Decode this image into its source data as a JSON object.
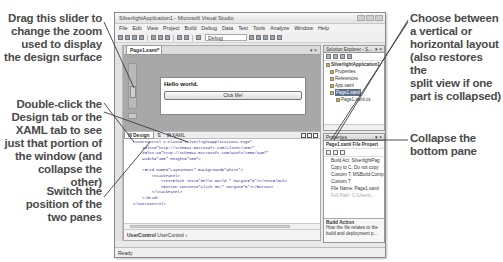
{
  "callouts": {
    "zoom_slider": [
      "Drag this slider to",
      "change the zoom",
      "used to display",
      "the design surface"
    ],
    "double_click": [
      "Double-click the",
      "Design tab or the",
      "XAML tab to see",
      "just that portion of",
      "the window (and",
      "collapse the other)"
    ],
    "switch_panes": [
      "Switch the",
      "position of the",
      "two panes"
    ],
    "layout": [
      "Choose between",
      "a vertical or",
      "horizontal layout",
      "(also restores the",
      "split view if one",
      "part is collapsed)"
    ],
    "collapse": [
      "Collapse the",
      "bottom pane"
    ]
  },
  "window": {
    "title": "SilverlightApplication1 - Microsoft Visual Studio",
    "menu": [
      "File",
      "Edit",
      "View",
      "Project",
      "Build",
      "Debug",
      "Data",
      "Test",
      "Tools",
      "Analyze",
      "Window",
      "Help"
    ],
    "toolbar": {
      "config_combo": "Debug"
    },
    "status": "Ready"
  },
  "document": {
    "tab_label": "Page1.xaml*",
    "design": {
      "text_block": "Hello world.",
      "button_content": "Click Me!"
    },
    "split_bar": {
      "design_tab": "Design",
      "swap_button": "⇅",
      "xaml_tab": "XAML"
    },
    "xaml_lines": [
      "<UserControl x:Class=\"SilverlightApplication1.Page\"",
      "    xmlns=\"http://schemas.microsoft.com/client/2007\"",
      "    xmlns:x=\"http://schemas.microsoft.com/winfx/2006/xaml\"",
      "    Width=\"400\" Height=\"100\">",
      "",
      "    <Grid Name=\"LayoutRoot\" Background=\"White\">",
      "        <StackPanel>",
      "            <TextBlock Text=\"Hello world.\" Margin=\"5\"></TextBlock>",
      "            <Button Content=\"Click Me!\" Margin=\"5\"></Button>",
      "        </StackPanel>",
      "    </Grid>",
      "</UserControl>"
    ],
    "breadcrumb": {
      "active": "UserControl",
      "item": "UserControl"
    }
  },
  "solution_explorer": {
    "title": "Solution Explorer - S...",
    "items": [
      {
        "label": "SilverlightApplication1",
        "level": 0
      },
      {
        "label": "Properties",
        "level": 1
      },
      {
        "label": "References",
        "level": 1
      },
      {
        "label": "App.xaml",
        "level": 1
      },
      {
        "label": "Page1.xaml",
        "level": 1,
        "selected": true
      },
      {
        "label": "Page1.xaml.cs",
        "level": 2
      }
    ]
  },
  "properties": {
    "title": "Properties",
    "target": "Page1.xaml File Propert",
    "rows": [
      {
        "label": "Build Act: SilverlightPag"
      },
      {
        "label": "Copy to C: Do not copy"
      },
      {
        "label": "Custom T: MSBuild:Comp"
      },
      {
        "label": "Custom T"
      },
      {
        "label": "File Name: Page1.xaml"
      },
      {
        "label": "Full Path: C:\\Users\\...",
        "dim": true
      }
    ],
    "desc_title": "Build Action",
    "desc_text": [
      "How the file relates to the",
      "build and deployment p..."
    ]
  }
}
